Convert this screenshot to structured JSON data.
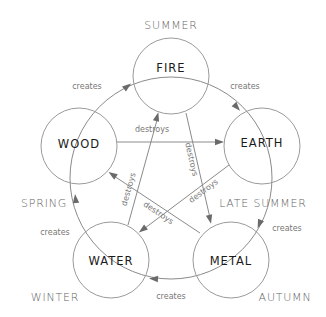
{
  "diagram": {
    "elements": [
      {
        "id": "fire",
        "label": "FIRE",
        "season": "SUMMER"
      },
      {
        "id": "earth",
        "label": "EARTH",
        "season": "LATE SUMMER"
      },
      {
        "id": "metal",
        "label": "METAL",
        "season": "AUTUMN"
      },
      {
        "id": "water",
        "label": "WATER",
        "season": "WINTER"
      },
      {
        "id": "wood",
        "label": "WOOD",
        "season": "SPRING"
      }
    ],
    "relations": {
      "creates_label": "creates",
      "destroys_label": "destroys",
      "creates": [
        {
          "from": "wood",
          "to": "fire",
          "label": "creates"
        },
        {
          "from": "fire",
          "to": "earth",
          "label": "creates"
        },
        {
          "from": "earth",
          "to": "metal",
          "label": "creates"
        },
        {
          "from": "metal",
          "to": "water",
          "label": "creates"
        },
        {
          "from": "water",
          "to": "wood",
          "label": "creates"
        }
      ],
      "destroys": [
        {
          "from": "wood",
          "to": "earth",
          "label": "destroys"
        },
        {
          "from": "fire",
          "to": "metal",
          "label": "destroys"
        },
        {
          "from": "earth",
          "to": "water",
          "label": "destroys"
        },
        {
          "from": "metal",
          "to": "wood",
          "label": "destroys"
        },
        {
          "from": "water",
          "to": "fire",
          "label": "destroys"
        }
      ]
    },
    "colors": {
      "circle_stroke": "#9a9a9a",
      "arrow": "#6a6a6a",
      "element_text": "#1a1a1a",
      "season_text": "#666666"
    }
  }
}
